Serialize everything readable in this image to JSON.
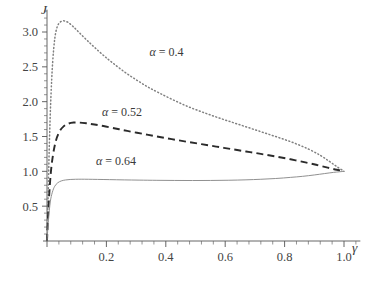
{
  "chart_data": {
    "type": "line",
    "title": "",
    "xlabel": "γ",
    "ylabel": "J",
    "xlim": [
      0,
      1.06
    ],
    "ylim": [
      0,
      3.35
    ],
    "grid": false,
    "legend_position": "inline-annotations",
    "xticks": [
      0.2,
      0.4,
      0.6,
      0.8,
      1.0
    ],
    "xtick_labels": [
      "0.2",
      "0.4",
      "0.6",
      "0.8",
      "1.0"
    ],
    "yticks": [
      0.5,
      1.0,
      1.5,
      2.0,
      2.5,
      3.0
    ],
    "ytick_labels": [
      "0.5",
      "1.0",
      "1.5",
      "2.0",
      "2.5",
      "3.0"
    ],
    "minor_tick_count_x": 4,
    "minor_tick_count_y": 4,
    "series": [
      {
        "name": "α = 0.4",
        "style": "dotted",
        "color": "#808080",
        "label_x": 0.345,
        "label_y": 2.66,
        "x": [
          0.0,
          0.004,
          0.008,
          0.013,
          0.019,
          0.026,
          0.034,
          0.044,
          0.056,
          0.07,
          0.09,
          0.11,
          0.135,
          0.16,
          0.19,
          0.22,
          0.26,
          0.3,
          0.34,
          0.38,
          0.43,
          0.48,
          0.53,
          0.58,
          0.63,
          0.68,
          0.73,
          0.78,
          0.83,
          0.88,
          0.92,
          0.95,
          0.975,
          1.0
        ],
        "y": [
          0.0,
          0.7,
          1.4,
          2.05,
          2.56,
          2.9,
          3.07,
          3.14,
          3.16,
          3.14,
          3.07,
          2.985,
          2.88,
          2.78,
          2.665,
          2.56,
          2.43,
          2.315,
          2.21,
          2.12,
          2.015,
          1.92,
          1.84,
          1.765,
          1.695,
          1.625,
          1.555,
          1.485,
          1.41,
          1.32,
          1.23,
          1.145,
          1.07,
          1.0
        ]
      },
      {
        "name": "α = 0.52",
        "style": "dashed",
        "color": "#2b2b2b",
        "label_x": 0.185,
        "label_y": 1.8,
        "x": [
          0.0,
          0.005,
          0.012,
          0.02,
          0.03,
          0.042,
          0.056,
          0.072,
          0.09,
          0.11,
          0.135,
          0.16,
          0.19,
          0.23,
          0.27,
          0.32,
          0.37,
          0.42,
          0.47,
          0.52,
          0.57,
          0.62,
          0.67,
          0.72,
          0.77,
          0.82,
          0.87,
          0.91,
          0.945,
          0.975,
          1.0
        ],
        "y": [
          0.0,
          0.48,
          0.94,
          1.23,
          1.44,
          1.57,
          1.645,
          1.685,
          1.7,
          1.7,
          1.688,
          1.672,
          1.65,
          1.615,
          1.58,
          1.54,
          1.5,
          1.462,
          1.425,
          1.39,
          1.355,
          1.32,
          1.285,
          1.25,
          1.213,
          1.173,
          1.128,
          1.09,
          1.053,
          1.022,
          1.0
        ]
      },
      {
        "name": "α = 0.64",
        "style": "solid",
        "color": "#8a8a8a",
        "label_x": 0.165,
        "label_y": 1.09,
        "x": [
          0.0,
          0.005,
          0.011,
          0.018,
          0.026,
          0.036,
          0.048,
          0.062,
          0.078,
          0.096,
          0.115,
          0.14,
          0.17,
          0.21,
          0.26,
          0.31,
          0.37,
          0.43,
          0.49,
          0.55,
          0.61,
          0.67,
          0.72,
          0.77,
          0.82,
          0.86,
          0.9,
          0.935,
          0.965,
          1.0
        ],
        "y": [
          0.0,
          0.3,
          0.56,
          0.7,
          0.785,
          0.835,
          0.862,
          0.876,
          0.883,
          0.886,
          0.887,
          0.886,
          0.884,
          0.881,
          0.877,
          0.874,
          0.871,
          0.869,
          0.868,
          0.869,
          0.872,
          0.878,
          0.886,
          0.897,
          0.913,
          0.928,
          0.948,
          0.968,
          0.985,
          1.0
        ]
      }
    ]
  },
  "axis": {
    "y_name": "J",
    "x_name": "γ"
  }
}
